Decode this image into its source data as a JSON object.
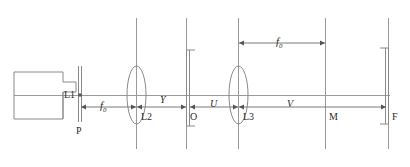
{
  "figure": {
    "type": "optical-bench-diagram",
    "ink_color": "#8a8a8a",
    "label_color": "#2b2b2b"
  },
  "components": {
    "source_label": "L1",
    "pinhole_label": "P",
    "lens2_label": "L2",
    "object_label": "O",
    "lens3_label": "L3",
    "mask_label": "M",
    "film_label": "F"
  },
  "dimensions": {
    "focal_left": "f",
    "focal_left_sub": "0",
    "focal_right": "f",
    "focal_right_sub": "0",
    "seg_y": "Y",
    "seg_u": "U",
    "seg_v": "V"
  }
}
